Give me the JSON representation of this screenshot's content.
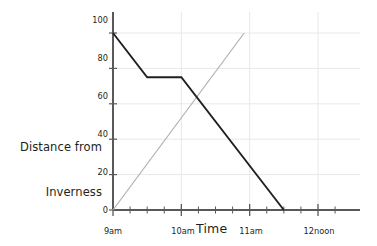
{
  "chart_data": {
    "type": "line",
    "title": "",
    "xlabel": "Time",
    "ylabel": "Distance from Inverness",
    "ylabel_line1": "Distance from",
    "ylabel_line2": "Inverness",
    "xlim": [
      9,
      12.25
    ],
    "ylim": [
      0,
      100
    ],
    "ytick_values": [
      0,
      20,
      40,
      60,
      80,
      100
    ],
    "ytick_labels": [
      "0",
      "20",
      "40",
      "60",
      "80",
      "100"
    ],
    "xtick_values": [
      9,
      10,
      11,
      12
    ],
    "xtick_labels": [
      "9am",
      "10am",
      "11am",
      "12noon"
    ],
    "minor_xtick_interval_hours": 0.25,
    "grid": true,
    "grid_color": "#e8e8ec",
    "axis_color": "#58595b",
    "legend": "none",
    "series": [
      {
        "name": "return-journey",
        "color": "#231f20",
        "width": 1.9,
        "points": [
          {
            "x": 9.0,
            "y": 100
          },
          {
            "x": 9.5,
            "y": 75
          },
          {
            "x": 10.0,
            "y": 75
          },
          {
            "x": 11.5,
            "y": 0
          }
        ]
      },
      {
        "name": "outward-journey",
        "color": "#b0b0b4",
        "width": 1.2,
        "points": [
          {
            "x": 9.0,
            "y": 0
          },
          {
            "x": 10.92,
            "y": 100
          }
        ]
      }
    ]
  },
  "labels": {
    "y_axis_title_line1": "Distance from",
    "y_axis_title_line2": "Inverness",
    "x_axis_title": "Time",
    "y_0": "0",
    "y_20": "20",
    "y_40": "40",
    "y_60": "60",
    "y_80": "80",
    "y_100": "100",
    "x_9am": "9am",
    "x_10am": "10am",
    "x_11am": "11am",
    "x_12noon": "12noon"
  }
}
